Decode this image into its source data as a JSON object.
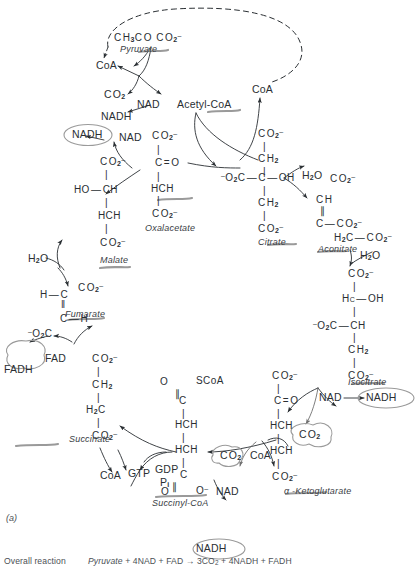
{
  "figure": {
    "panel_letter": "(a)",
    "title_type": "citric-acid-cycle-diagram",
    "overall_reaction_label": "Overall reaction",
    "overall_reaction": "Pyruvate + 4NAD + FAD → 3CO2 + 4NADH + FADH"
  },
  "colors": {
    "ink": "#2a2f33",
    "annotation_gray": "#8b8b8b",
    "underline_gray": "#9a9a9a",
    "background": "#ffffff"
  },
  "intermediates": [
    {
      "id": "pyruvate",
      "name": "Pyruvate",
      "formula": "CH3CO CO2-"
    },
    {
      "id": "oxalacetate",
      "name": "Oxalacetate",
      "formula": "CO2- C=O HCH CO2-"
    },
    {
      "id": "citrate",
      "name": "Citrate",
      "formula": "CO2- CH2 -O2C-C-OH CH2 CO2-"
    },
    {
      "id": "aconitate",
      "name": "Aconitate",
      "formula": "CO2- CH C-CO2- H2C-CO2-"
    },
    {
      "id": "isocitrate",
      "name": "Isocitrate",
      "formula": "CO2- HC-OH -O2C-CH CH2 CO2-"
    },
    {
      "id": "ketoglutarate",
      "name": "α -Ketoglutarate",
      "formula": "CO2- C=O HCH HCH CO2-"
    },
    {
      "id": "succinyl-coa",
      "name": "Succinyl-CoA",
      "formula": "O=C-SCoA HCH HCH C(=O)-O-"
    },
    {
      "id": "succinate",
      "name": "Succinate",
      "formula": "CO2- CH2 H2C CO2-"
    },
    {
      "id": "fumarate",
      "name": "Fumarate",
      "formula": "H-C-CO2- C-H -O2C"
    },
    {
      "id": "malate",
      "name": "Malate",
      "formula": "CO2- HO-CH HCH CO2-"
    }
  ],
  "cofactors": [
    {
      "id": "coa-top-left",
      "label": "CoA"
    },
    {
      "id": "co2-top",
      "label": "CO2"
    },
    {
      "id": "nad-top",
      "label": "NAD"
    },
    {
      "id": "acetyl-coa",
      "label": "Acetyl-CoA"
    },
    {
      "id": "nadh-top",
      "label": "NADH"
    },
    {
      "id": "coa-top-right",
      "label": "CoA"
    },
    {
      "id": "nadh-circled-malate",
      "label": "NADH",
      "circled": true
    },
    {
      "id": "nad-malate",
      "label": "NAD"
    },
    {
      "id": "h2o-citrate",
      "label": "H2O"
    },
    {
      "id": "h2o-aconitate",
      "label": "H2O"
    },
    {
      "id": "h2o-fumarate",
      "label": "H2O"
    },
    {
      "id": "nad-isocitrate",
      "label": "NAD"
    },
    {
      "id": "nadh-circled-isocitrate",
      "label": "NADH",
      "circled": true
    },
    {
      "id": "co2-circled-isocitrate",
      "label": "CO2",
      "circled": true
    },
    {
      "id": "coa-ketoglutarate",
      "label": "CoA"
    },
    {
      "id": "co2-circled-ketoglutarate",
      "label": "CO2",
      "circled": true
    },
    {
      "id": "nad-ketoglutarate",
      "label": "NAD"
    },
    {
      "id": "nadh-circled-bottom",
      "label": "NADH",
      "circled": true
    },
    {
      "id": "coa-succinate",
      "label": "CoA"
    },
    {
      "id": "gtp",
      "label": "GTP"
    },
    {
      "id": "gdp",
      "label": "GDP"
    },
    {
      "id": "pi",
      "label": "Pi"
    },
    {
      "id": "fad",
      "label": "FAD"
    },
    {
      "id": "fadh-circled",
      "label": "FADH",
      "circled": true
    }
  ],
  "atoms": {
    "c": "C",
    "ch": "CH",
    "hch": "HCH",
    "ch2": "CH2",
    "h2c": "H2C",
    "hc": "HC",
    "oh": "OH",
    "ho": "HO",
    "h": "H",
    "o": "O",
    "o_minus": "O-",
    "co2_minus": "CO2-",
    "neg_o2c": "-O2C",
    "scoa": "SCoA",
    "c_eq_o": "C=O"
  }
}
